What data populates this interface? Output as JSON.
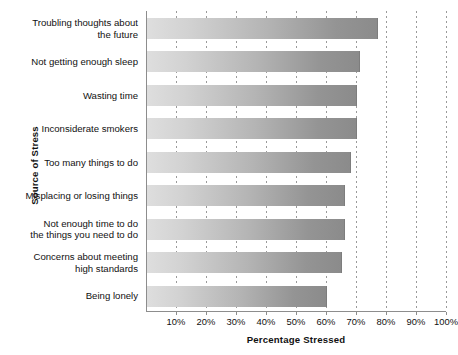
{
  "chart_data": {
    "type": "bar",
    "orientation": "horizontal",
    "title": "",
    "xlabel": "Percentage  Stressed",
    "ylabel": "Source of Stress",
    "xlim": [
      0,
      100
    ],
    "grid": true,
    "legend": false,
    "tick_labels": [
      "10%",
      "20%",
      "30%",
      "40%",
      "50%",
      "60%",
      "70%",
      "80%",
      "90%",
      "100%"
    ],
    "tick_values": [
      10,
      20,
      30,
      40,
      50,
      60,
      70,
      80,
      90,
      100
    ],
    "categories": [
      "Troubling thoughts about\nthe future",
      "Not getting enough sleep",
      "Wasting time",
      "Inconsiderate smokers",
      "Too many things to do",
      "Misplacing or losing things",
      "Not enough time to do\nthe things you need to do",
      "Concerns about meeting\nhigh standards",
      "Being lonely"
    ],
    "values": [
      77,
      71,
      70,
      70,
      68,
      66,
      66,
      65,
      60
    ],
    "bar_gradient_start": "#dedede",
    "bar_gradient_end": "#8b8b8b",
    "axis_color": "#8d8d8d",
    "gridline_color": "#9a9a9a",
    "text_color": "#111111"
  }
}
